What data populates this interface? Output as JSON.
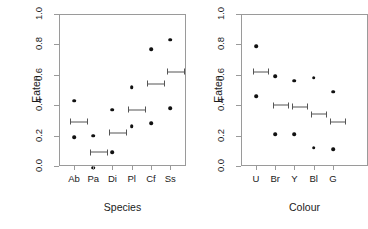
{
  "figure": {
    "background": "#ffffff",
    "point_color": "#111111",
    "interval_color": "#555555",
    "axis_color": "#9a9a9a",
    "text_color": "#1a1a1a"
  },
  "chart_data": [
    {
      "type": "scatter",
      "panel": "left",
      "title": "",
      "xlabel": "Species",
      "ylabel": "Eaten",
      "ylim": [
        0.0,
        1.0
      ],
      "yticks": [
        0.0,
        0.2,
        0.4,
        0.6,
        0.8,
        1.0
      ],
      "ytick_labels": [
        "0.0",
        "0.2",
        "0.4",
        "0.6",
        "0.8",
        "1.0"
      ],
      "grid": false,
      "legend": "none",
      "categories": [
        "Ab",
        "Pa",
        "Di",
        "Pl",
        "Cf",
        "Ss"
      ],
      "series": [
        {
          "name": "observed-upper",
          "marker": "filled-circle",
          "values": [
            0.43,
            0.2,
            0.37,
            0.52,
            0.77,
            0.83
          ]
        },
        {
          "name": "observed-lower",
          "marker": "filled-circle",
          "values": [
            0.19,
            -0.01,
            0.09,
            0.26,
            0.28,
            0.38
          ]
        },
        {
          "name": "predicted-interval",
          "marker": "error-bar",
          "values": [
            0.29,
            0.09,
            0.22,
            0.37,
            0.54,
            0.62
          ],
          "x_offset": 0.28,
          "half_width_px": 9
        }
      ]
    },
    {
      "type": "scatter",
      "panel": "right",
      "title": "",
      "xlabel": "Colour",
      "ylabel": "Eaten",
      "ylim": [
        0.0,
        1.0
      ],
      "yticks": [
        0.0,
        0.2,
        0.4,
        0.6,
        0.8,
        1.0
      ],
      "ytick_labels": [
        "0.0",
        "0.2",
        "0.4",
        "0.6",
        "0.8",
        "1.0"
      ],
      "grid": false,
      "legend": "none",
      "note": "right panel is clipped by the image edge",
      "categories": [
        "U",
        "Br",
        "Y",
        "Bl",
        "G"
      ],
      "series": [
        {
          "name": "observed-upper",
          "marker": "filled-circle",
          "values": [
            0.79,
            0.59,
            0.56,
            0.58,
            0.49
          ]
        },
        {
          "name": "observed-lower",
          "marker": "filled-circle",
          "values": [
            0.46,
            0.21,
            0.21,
            0.12,
            0.11
          ]
        },
        {
          "name": "predicted-interval",
          "marker": "error-bar",
          "values": [
            0.62,
            0.4,
            0.39,
            0.34,
            0.29
          ],
          "x_offset": 0.28,
          "half_width_px": 8
        }
      ]
    }
  ]
}
